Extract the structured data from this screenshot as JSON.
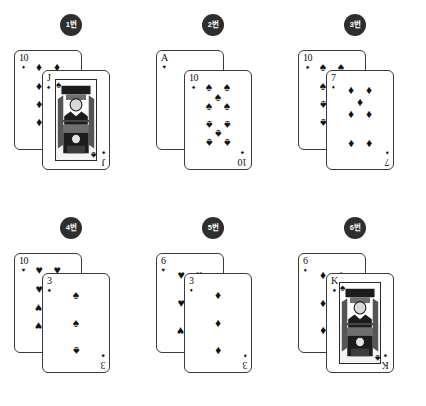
{
  "groups": [
    {
      "badge": "1번",
      "back": {
        "rank": "10",
        "suit_name": "diamonds",
        "suit": "♦",
        "count": 10,
        "type": "number"
      },
      "front": {
        "rank": "J",
        "suit_name": "spades",
        "suit": "♠",
        "type": "face"
      }
    },
    {
      "badge": "2번",
      "back": {
        "rank": "A",
        "suit_name": "hearts",
        "suit": "♥",
        "count": 1,
        "type": "number"
      },
      "front": {
        "rank": "10",
        "suit_name": "spades",
        "suit": "♠",
        "count": 10,
        "type": "number"
      }
    },
    {
      "badge": "3번",
      "back": {
        "rank": "10",
        "suit_name": "spades",
        "suit": "♠",
        "count": 10,
        "type": "number"
      },
      "front": {
        "rank": "7",
        "suit_name": "diamonds",
        "suit": "♦",
        "count": 7,
        "type": "number"
      }
    },
    {
      "badge": "4번",
      "back": {
        "rank": "10",
        "suit_name": "hearts",
        "suit": "♥",
        "count": 10,
        "type": "number"
      },
      "front": {
        "rank": "3",
        "suit_name": "spades",
        "suit": "♠",
        "count": 3,
        "type": "number"
      }
    },
    {
      "badge": "5번",
      "back": {
        "rank": "6",
        "suit_name": "hearts",
        "suit": "♥",
        "count": 6,
        "type": "number"
      },
      "front": {
        "rank": "3",
        "suit_name": "diamonds",
        "suit": "♦",
        "count": 3,
        "type": "number"
      }
    },
    {
      "badge": "6번",
      "back": {
        "rank": "6",
        "suit_name": "diamonds",
        "suit": "♦",
        "count": 6,
        "type": "number"
      },
      "front": {
        "rank": "K",
        "suit_name": "spades",
        "suit": "♠",
        "type": "face"
      }
    }
  ],
  "colors": {
    "background": "#ffffff",
    "badge_bg": "#2e2e2e",
    "badge_text": "#ffffff",
    "card_bg": "#ffffff",
    "card_border": "#3a3a3a",
    "ink": "#111111"
  }
}
